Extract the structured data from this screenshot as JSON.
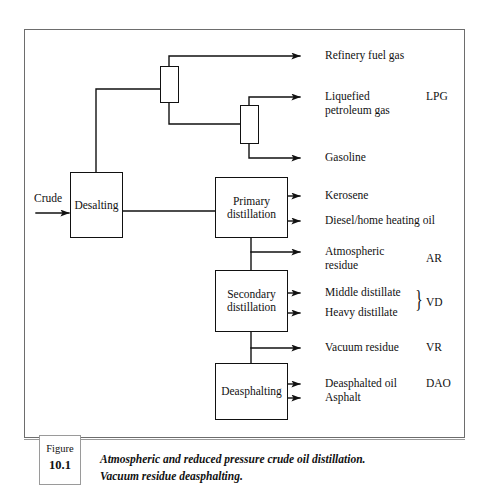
{
  "figure": {
    "tag_word": "Figure",
    "tag_number": "10.1",
    "caption": "Atmospheric and reduced pressure crude oil distillation.\nVacuum residue deasphalting."
  },
  "feed": {
    "label": "Crude"
  },
  "process_boxes": [
    {
      "id": "desalting",
      "label": "Desalting"
    },
    {
      "id": "primary-distillation",
      "label": "Primary\ndistillation"
    },
    {
      "id": "secondary-distillation",
      "label": "Secondary\ndistillation"
    },
    {
      "id": "deasphalting",
      "label": "Deasphalting"
    }
  ],
  "columns": [
    {
      "id": "gas-separator-column",
      "label": ""
    },
    {
      "id": "lpg-splitter-column",
      "label": ""
    }
  ],
  "products": [
    {
      "id": "refinery-fuel-gas",
      "label": "Refinery fuel gas",
      "abbr": ""
    },
    {
      "id": "liquefied-petroleum-gas",
      "label": "Liquefied\npetroleum gas",
      "abbr": "LPG"
    },
    {
      "id": "gasoline",
      "label": "Gasoline",
      "abbr": ""
    },
    {
      "id": "kerosene",
      "label": "Kerosene",
      "abbr": ""
    },
    {
      "id": "diesel-home-heating-oil",
      "label": "Diesel/home heating oil",
      "abbr": ""
    },
    {
      "id": "atmospheric-residue",
      "label": "Atmospheric\nresidue",
      "abbr": "AR"
    },
    {
      "id": "middle-distillate",
      "label": "Middle distillate",
      "abbr": ""
    },
    {
      "id": "heavy-distillate",
      "label": "Heavy distillate",
      "abbr": "VD"
    },
    {
      "id": "vacuum-residue",
      "label": "Vacuum residue",
      "abbr": "VR"
    },
    {
      "id": "deasphalted-oil",
      "label": "Deasphalted oil",
      "abbr": "DAO"
    },
    {
      "id": "asphalt",
      "label": "Asphalt",
      "abbr": ""
    }
  ],
  "brace": {
    "glyph": "}"
  },
  "colors": {
    "line": "#111111",
    "frame": "#6d6d6d",
    "text": "#111111",
    "background": "#ffffff"
  }
}
